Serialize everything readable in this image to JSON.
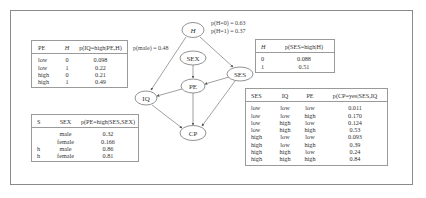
{
  "graph": {
    "nodes": [
      {
        "id": "H",
        "label": "H",
        "italic": true
      },
      {
        "id": "SEX",
        "label": "SEX"
      },
      {
        "id": "SES",
        "label": "SES"
      },
      {
        "id": "PE",
        "label": "PE"
      },
      {
        "id": "IQ",
        "label": "IQ"
      },
      {
        "id": "CP",
        "label": "CP"
      }
    ],
    "edges": [
      [
        "H",
        "IQ"
      ],
      [
        "H",
        "SES"
      ],
      [
        "SEX",
        "PE"
      ],
      [
        "SES",
        "PE"
      ],
      [
        "PE",
        "IQ"
      ],
      [
        "PE",
        "CP"
      ],
      [
        "IQ",
        "CP"
      ],
      [
        "SES",
        "CP"
      ]
    ]
  },
  "annotations": {
    "p_male": "p(male) = 0.48",
    "p_h0": "p(H=0) = 0.63",
    "p_h1": "p(H=1) = 0.37"
  },
  "table_iq": {
    "headers": [
      "PE",
      "H",
      "p(IQ=high|PE,H)"
    ],
    "rows": [
      [
        "low",
        "0",
        "0.098"
      ],
      [
        "low",
        "1",
        "0.22"
      ],
      [
        "high",
        "0",
        "0.21"
      ],
      [
        "high",
        "1",
        "0.49"
      ]
    ]
  },
  "table_ses": {
    "headers": [
      "H",
      "p(SES=high|H)"
    ],
    "rows": [
      [
        "0",
        "0.088"
      ],
      [
        "1",
        "0.51"
      ]
    ]
  },
  "table_pe": {
    "headers": [
      "S",
      "SEX",
      "p(PE=high|SES,SEX)"
    ],
    "rows": [
      [
        "",
        "male",
        "0.32"
      ],
      [
        "",
        "female",
        "0.166"
      ],
      [
        "h",
        "male",
        "0.86"
      ],
      [
        "h",
        "female",
        "0.81"
      ]
    ]
  },
  "table_cp": {
    "headers": [
      "SES",
      "IQ",
      "PE",
      "p(CP=yes|SES,IQ"
    ],
    "rows": [
      [
        "low",
        "low",
        "low",
        "0.011"
      ],
      [
        "low",
        "low",
        "high",
        "0.170"
      ],
      [
        "low",
        "high",
        "low",
        "0.124"
      ],
      [
        "low",
        "high",
        "high",
        "0.53"
      ],
      [
        "high",
        "low",
        "low",
        "0.093"
      ],
      [
        "high",
        "low",
        "high",
        "0.39"
      ],
      [
        "high",
        "high",
        "low",
        "0.24"
      ],
      [
        "high",
        "high",
        "high",
        "0.84"
      ]
    ]
  }
}
